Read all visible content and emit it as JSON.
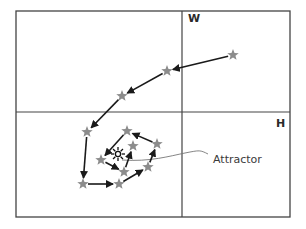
{
  "diagram": {
    "type": "phase-space-trajectory",
    "frame": {
      "x": 16,
      "y": 11,
      "width": 274,
      "height": 206,
      "stroke": "#444444"
    },
    "dividers": {
      "vertical_x": 182,
      "horizontal_y": 112
    },
    "labels": {
      "top_right": "W",
      "bottom_right": "H",
      "attractor": "Attractor"
    },
    "colors": {
      "star_fill": "#8c8c8c",
      "arrow": "#1a1a1a",
      "line": "#444444",
      "leader": "#777777"
    },
    "attractor_point": {
      "x": 118,
      "y": 154
    },
    "trajectory": [
      {
        "x": 233,
        "y": 55
      },
      {
        "x": 167,
        "y": 71
      },
      {
        "x": 122,
        "y": 96
      },
      {
        "x": 87,
        "y": 132
      },
      {
        "x": 83,
        "y": 184
      },
      {
        "x": 119,
        "y": 184
      },
      {
        "x": 148,
        "y": 167
      },
      {
        "x": 157,
        "y": 144
      },
      {
        "x": 127,
        "y": 131
      },
      {
        "x": 101,
        "y": 160
      },
      {
        "x": 124,
        "y": 172
      },
      {
        "x": 133,
        "y": 146
      }
    ]
  }
}
